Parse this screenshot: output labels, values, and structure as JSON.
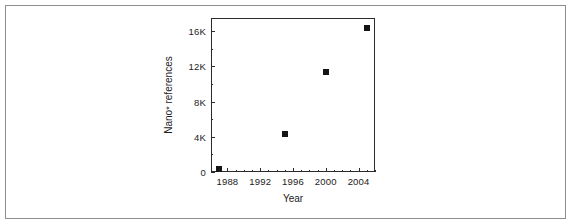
{
  "figure": {
    "border_color": "#8d8d8d",
    "background": "#ffffff"
  },
  "chart_data": {
    "type": "scatter",
    "title": "",
    "xlabel": "Year",
    "ylabel_prefix": "Nano",
    "ylabel_superscript": "*",
    "ylabel_suffix": " references",
    "ylabel_full": "Nano* references",
    "xlim": [
      1986,
      2006
    ],
    "ylim": [
      0,
      17500
    ],
    "grid": false,
    "legend": null,
    "marker_style": "filled-square",
    "marker_color": "#141414",
    "axis_color": "#2b2b2b",
    "xticks": [
      1988,
      1992,
      1996,
      2000,
      2004
    ],
    "xticklabels": [
      "1988",
      "1992",
      "1996",
      "2000",
      "2004"
    ],
    "x_minor_tick_interval": 1,
    "yticks": [
      0,
      4000,
      8000,
      12000,
      16000
    ],
    "yticklabels": [
      "0",
      "4K",
      "8K",
      "12K",
      "16K"
    ],
    "y_minor_tick_interval": 2000,
    "x": [
      1987,
      1995,
      2000,
      2005
    ],
    "y": [
      300,
      4300,
      11400,
      16400
    ],
    "points": [
      {
        "x": 1987,
        "y": 300
      },
      {
        "x": 1995,
        "y": 4300
      },
      {
        "x": 2000,
        "y": 11400
      },
      {
        "x": 2005,
        "y": 16400
      }
    ]
  }
}
